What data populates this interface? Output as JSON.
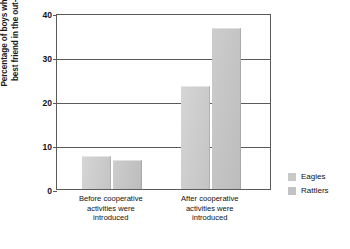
{
  "chart_data": {
    "type": "bar",
    "title": "",
    "xlabel": "",
    "ylabel": "Percentage of boys who had a\nbest friend in the out-group",
    "categories": [
      "Before cooperative\nactivities were\nintroduced",
      "After cooperative\nactivities were\nintroduced"
    ],
    "series": [
      {
        "name": "Eagles",
        "values": [
          7.5,
          23.5
        ],
        "color": "#cfcfcf"
      },
      {
        "name": "Rattlers",
        "values": [
          6.5,
          36.5
        ],
        "color": "#c6c6c6"
      }
    ],
    "ylim": [
      0,
      40
    ],
    "yticks": [
      0,
      10,
      20,
      30,
      40
    ],
    "ytick_labels": [
      "0",
      "10",
      "20",
      "30",
      "40"
    ],
    "grid": true,
    "legend_position": "right"
  },
  "legend": {
    "items": [
      {
        "label": "Eagles"
      },
      {
        "label": "Rattlers"
      }
    ]
  },
  "axis": {
    "y_title": "Percentage of boys who had a\nbest friend in the out-group",
    "ticks": [
      "0",
      "10",
      "20",
      "30",
      "40"
    ]
  }
}
